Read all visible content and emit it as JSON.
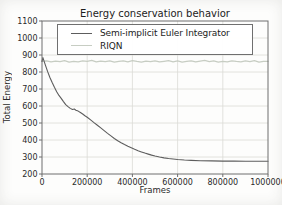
{
  "figure": {
    "title": "Energy conservation behavior",
    "xlabel": "Frames",
    "ylabel": "Total Energy"
  },
  "chart_data": {
    "type": "line",
    "title": "Energy conservation behavior",
    "xlabel": "Frames",
    "ylabel": "Total Energy",
    "xlim": [
      0,
      1000000
    ],
    "ylim": [
      200,
      1100
    ],
    "xticks": [
      0,
      200000,
      400000,
      600000,
      800000,
      1000000
    ],
    "yticks": [
      200,
      300,
      400,
      500,
      600,
      700,
      800,
      900,
      1000,
      1100
    ],
    "grid": true,
    "legend_position": "upper center",
    "legend_border": true,
    "series": [
      {
        "name": "Semi-implicit Euler Integrator",
        "color": "#5d5d5d",
        "width": 1.1,
        "x": [
          0,
          4000,
          8000,
          15000,
          25000,
          35000,
          45000,
          55000,
          65000,
          75000,
          85000,
          95000,
          105000,
          115000,
          125000,
          135000,
          143000,
          150000,
          160000,
          170000,
          180000,
          190000,
          200000,
          215000,
          230000,
          245000,
          260000,
          275000,
          290000,
          305000,
          320000,
          335000,
          350000,
          365000,
          380000,
          395000,
          410000,
          425000,
          440000,
          455000,
          470000,
          485000,
          500000,
          520000,
          540000,
          560000,
          580000,
          600000,
          630000,
          660000,
          700000,
          750000,
          800000,
          850000,
          900000,
          950000,
          1000000
        ],
        "y": [
          862,
          885,
          868,
          840,
          802,
          768,
          738,
          710,
          684,
          662,
          645,
          626,
          608,
          596,
          586,
          579,
          582,
          575,
          570,
          562,
          553,
          543,
          534,
          518,
          502,
          487,
          471,
          455,
          439,
          424,
          409,
          396,
          384,
          373,
          363,
          354,
          345,
          337,
          330,
          323,
          317,
          311,
          306,
          300,
          295,
          291,
          288,
          285,
          282,
          280,
          278,
          277,
          276,
          276,
          275,
          275,
          275
        ]
      },
      {
        "name": "RIQN",
        "color": "#c7cdc3",
        "width": 1.3,
        "x": [
          0,
          20000,
          40000,
          60000,
          80000,
          100000,
          120000,
          140000,
          160000,
          180000,
          200000,
          220000,
          240000,
          260000,
          280000,
          300000,
          320000,
          340000,
          360000,
          380000,
          400000,
          420000,
          440000,
          460000,
          480000,
          500000,
          520000,
          540000,
          560000,
          580000,
          600000,
          620000,
          640000,
          660000,
          680000,
          700000,
          720000,
          740000,
          760000,
          780000,
          800000,
          820000,
          840000,
          860000,
          880000,
          900000,
          920000,
          940000,
          960000,
          980000,
          1000000
        ],
        "y": [
          862,
          866,
          859,
          864,
          861,
          867,
          858,
          863,
          860,
          865,
          862,
          868,
          859,
          864,
          861,
          866,
          858,
          863,
          865,
          860,
          867,
          862,
          858,
          864,
          861,
          866,
          859,
          863,
          867,
          860,
          865,
          858,
          862,
          866,
          859,
          864,
          868,
          861,
          865,
          858,
          863,
          860,
          866,
          862,
          859,
          865,
          861,
          867,
          858,
          863,
          862
        ]
      }
    ]
  },
  "style": {
    "grid_color": "#dadad6",
    "spine_color": "#6e6e6e",
    "tick_label_color": "#2a2a2a"
  }
}
